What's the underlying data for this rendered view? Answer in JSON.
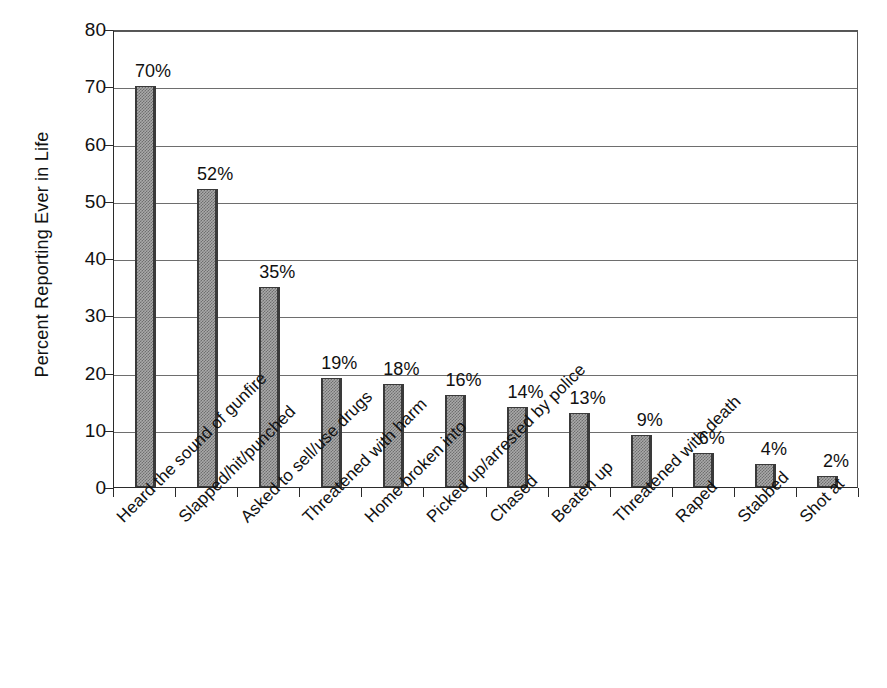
{
  "chart_data": {
    "type": "bar",
    "title": "",
    "subtitle": "",
    "xlabel": "",
    "ylabel": "Percent Reporting Ever in Life",
    "ylim": [
      0,
      80
    ],
    "ytick_step": 10,
    "ytick_labels": [
      "0",
      "10",
      "20",
      "30",
      "40",
      "50",
      "60",
      "70",
      "80"
    ],
    "grid": true,
    "grid_axis": "y",
    "legend": false,
    "legend_position": "none",
    "value_label_suffix": "%",
    "categories": [
      "Heard the sound of gunfire",
      "Slapped/hit/punched",
      "Asked to sell/use drugs",
      "Threatened with harm",
      "Home broken into",
      "Picked up/arrested by police",
      "Chased",
      "Beaten up",
      "Threatened with death",
      "Raped",
      "Stabbed",
      "Shot at"
    ],
    "values": [
      70,
      52,
      35,
      19,
      18,
      16,
      14,
      13,
      9,
      6,
      4,
      2
    ],
    "value_labels": [
      "70%",
      "52%",
      "35%",
      "19%",
      "18%",
      "16%",
      "14%",
      "13%",
      "9%",
      "6%",
      "4%",
      "2%"
    ],
    "colors": {
      "bar_fill": "#a9a9a9",
      "bar_pattern": "#6f6f6f",
      "bar_border": "#3a3a3a",
      "axis": "#2b2b2b",
      "gridline": "#6e6e6e",
      "text": "#111111",
      "background": "#ffffff"
    }
  }
}
